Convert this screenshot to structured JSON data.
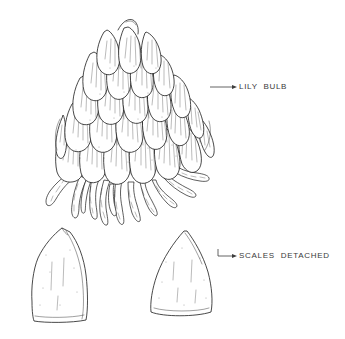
{
  "figure": {
    "kind": "botanical-line-illustration",
    "background_color": "#ffffff",
    "ink_color": "#1a1a1a",
    "label_color": "#3a3a3a"
  },
  "labels": [
    {
      "id": "lily-bulb",
      "text": "LILY BULB",
      "leader": {
        "x1": 210,
        "y1": 87,
        "x2": 237,
        "y2": 87
      },
      "arrow_at": "right"
    },
    {
      "id": "scales-detached",
      "text": "SCALES DETACHED",
      "leader": {
        "x1": 218,
        "y1": 256,
        "x2": 237,
        "y2": 256
      },
      "arrow_at": "right"
    }
  ],
  "parts": {
    "bulb": {
      "name": "lily bulb",
      "bounds": {
        "x": 55,
        "y": 12,
        "w": 160,
        "h": 203
      },
      "scale_tiers": 5,
      "root_count": 12
    },
    "detached_scale_left": {
      "name": "detached scale (left)",
      "bounds": {
        "x": 30,
        "y": 225,
        "w": 65,
        "h": 100
      },
      "apex": "rounded"
    },
    "detached_scale_right": {
      "name": "detached scale (right)",
      "bounds": {
        "x": 150,
        "y": 230,
        "w": 70,
        "h": 90
      },
      "apex": "pointed"
    }
  }
}
